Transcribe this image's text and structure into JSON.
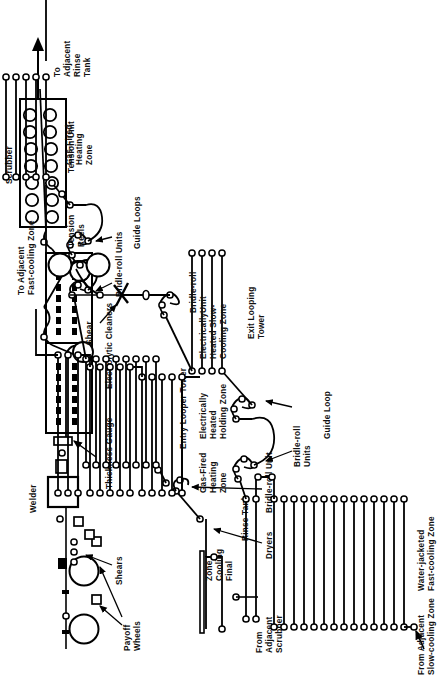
{
  "figure": {
    "type": "process-flow-diagram",
    "orientation": "rotated-90-ccw",
    "ink_color": "#000000",
    "background_color": "#ffffff"
  },
  "labels": {
    "payoff_wheels": "Payoff\nWheels",
    "shears": "Shears",
    "welder": "Welder",
    "thickness_gauge": "Thickness Gauge",
    "electrolytic_cleaners": "Electrolytic Cleaners",
    "scrubber": "Scrubber",
    "to_adjacent_rinse_tank": "To\nAdjacent\nRinse\nTank",
    "from_adjacent_scrubber": "From\nAdjacent\nScrubber",
    "rinse_tank": "Rinse Tank",
    "dryers": "Dryers",
    "bridle_roll_unit_entry": "Bridle-roll Unit",
    "entry_looper_tower": "Entry Looper Tower",
    "bridle_roll_units_entry": "Bridle-roll Units",
    "guide_loops": "Guide Loops",
    "tension_unit": "Tension Unit",
    "gas_fired_heating_zone": "Gas-Fired\nHeating\nZone",
    "electrically_heated_holding_zone": "Electrically\nHeated\nHolding Zone",
    "electrically_heated_slow_cooling_zone": "Electrically\nHeated Slow-\nCooling Zone",
    "to_adjacent_fast_cooling_zone": "To Adjacent\nFast-cooling Zone",
    "from_adjacent_slow_cooling_zone": "From Adjacent\nSlow-cooling Zone",
    "water_jacketed_fast_cooling_zone": "Water-jacketed\nFast-cooling Zone",
    "final_cooling_zone": "Final\nCooling\nZone",
    "bridle_roll_units_exit": "Bridle-roll\nUnits",
    "guide_loop": "Guide Loop",
    "exit_looping_tower": "Exit Looping\nTower",
    "bridle_roll_unit_exit": "Bridle-roll\nUnit",
    "shear": "Shear",
    "tension_reels": "Tension\nReels"
  },
  "label_lines": {
    "payoff_wheels": [
      "Payoff",
      "Wheels"
    ],
    "to_adjacent_rinse_tank": [
      "To",
      "Adjacent",
      "Rinse",
      "Tank"
    ],
    "from_adjacent_scrubber": [
      "From",
      "Adjacent",
      "Scrubber"
    ],
    "gas_fired_heating_zone": [
      "Gas-Fired",
      "Heating",
      "Zone"
    ],
    "electrically_heated_holding_zone": [
      "Electrically",
      "Heated",
      "Holding Zone"
    ],
    "electrically_heated_slow_cooling_zone": [
      "Electrically",
      "Heated Slow-",
      "Cooling Zone"
    ],
    "to_adjacent_fast_cooling_zone": [
      "To Adjacent",
      "Fast-cooling Zone"
    ],
    "from_adjacent_slow_cooling_zone": [
      "From Adjacent",
      "Slow-cooling Zone"
    ],
    "water_jacketed_fast_cooling_zone": [
      "Water-jacketed",
      "Fast-cooling Zone"
    ],
    "final_cooling_zone": [
      "Final",
      "Cooling",
      "Zone"
    ],
    "bridle_roll_units_exit": [
      "Bridle-roll",
      "Units"
    ],
    "exit_looping_tower": [
      "Exit Looping",
      "Tower"
    ],
    "bridle_roll_unit_exit": [
      "Bridle-roll",
      "Unit"
    ],
    "tension_reels": [
      "Tension",
      "Reels"
    ]
  },
  "sections": [
    {
      "name": "payoff-wheels",
      "passes": 0,
      "rolls": 2
    },
    {
      "name": "shears",
      "passes": 0,
      "rolls": 0
    },
    {
      "name": "welder",
      "passes": 0,
      "rolls": 0
    },
    {
      "name": "thickness-gauge",
      "passes": 0,
      "rolls": 0
    },
    {
      "name": "electrolytic-cleaners",
      "passes": 2,
      "rolls": 4
    },
    {
      "name": "scrubber",
      "passes": 0,
      "rolls": 14
    },
    {
      "name": "rinse-tank",
      "passes": 0,
      "rolls": 3
    },
    {
      "name": "dryers",
      "passes": 0,
      "rolls": 1
    },
    {
      "name": "entry-looper-tower",
      "passes": 8,
      "rolls": 16
    },
    {
      "name": "gas-fired-heating-zone",
      "passes": 5,
      "rolls": 10
    },
    {
      "name": "electrically-heated-holding-zone",
      "passes": 5,
      "rolls": 10
    },
    {
      "name": "electrically-heated-slow-cooling-zone",
      "passes": 3,
      "rolls": 6
    },
    {
      "name": "water-jacketed-fast-cooling-zone",
      "passes": 14,
      "rolls": 28
    },
    {
      "name": "final-cooling-zone",
      "passes": 2,
      "rolls": 4
    },
    {
      "name": "exit-looping-tower",
      "passes": 4,
      "rolls": 8
    },
    {
      "name": "tension-reels",
      "rolls": 2
    }
  ]
}
